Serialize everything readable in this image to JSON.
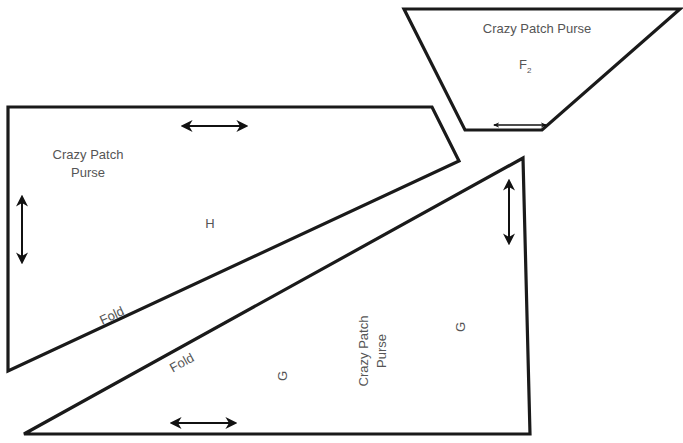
{
  "diagram": {
    "stroke_color": "#1a1a1a",
    "text_color": "#555555",
    "pieces": [
      {
        "id": "F2",
        "shape": "trapezoid",
        "title": "Crazy Patch Purse",
        "letter": "F",
        "subscript": "2",
        "grainline": "horizontal"
      },
      {
        "id": "H",
        "shape": "quadrilateral",
        "title_line1": "Crazy Patch",
        "title_line2": "Purse",
        "letter": "H",
        "fold_label": "Fold",
        "grainlines": [
          "horizontal",
          "vertical"
        ]
      },
      {
        "id": "G",
        "shape": "triangle",
        "title_line1": "Crazy Patch",
        "title_line2": "Purse",
        "letter_1": "G",
        "letter_2": "G",
        "fold_label": "Fold",
        "grainlines": [
          "horizontal",
          "vertical"
        ]
      }
    ]
  }
}
